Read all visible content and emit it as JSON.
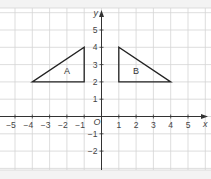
{
  "diagram": {
    "type": "coordinate-grid",
    "axes": {
      "x_label": "x",
      "y_label": "y",
      "origin_label": "O",
      "x_ticks": [
        "−5",
        "−4",
        "−3",
        "−2",
        "−1",
        "1",
        "2",
        "3",
        "4",
        "5"
      ],
      "y_ticks": [
        "5",
        "4",
        "3",
        "2",
        "1",
        "−1",
        "−2"
      ],
      "x_range": [
        -5,
        5
      ],
      "y_range": [
        -2,
        5
      ]
    },
    "shapes": [
      {
        "label": "A",
        "type": "triangle",
        "vertices": [
          [
            -4,
            2
          ],
          [
            -1,
            2
          ],
          [
            -1,
            4
          ]
        ]
      },
      {
        "label": "B",
        "type": "triangle",
        "vertices": [
          [
            1,
            2
          ],
          [
            4,
            2
          ],
          [
            1,
            4
          ]
        ]
      }
    ],
    "colors": {
      "grid": "#d4d4d4",
      "axis": "#333333",
      "shape_stroke": "#222222",
      "background": "#ffffff",
      "page": "#f3f3f3"
    }
  }
}
